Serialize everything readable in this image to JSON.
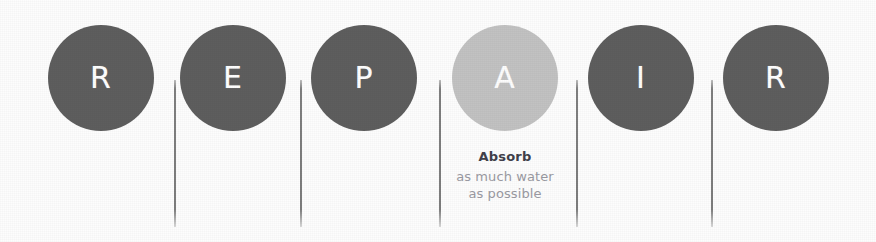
{
  "figure": {
    "acronym": "REPAIR",
    "background_color": "#fdfdfd",
    "dark_circle_color": "#5e5e5e",
    "light_circle_color": "#c2c2c2",
    "divider_color": "#787878",
    "letter_color": "#ffffff",
    "caption_title_color": "#40404a",
    "caption_body_color": "#9a9aa2"
  },
  "steps": [
    {
      "letter": "R",
      "highlighted": false,
      "caption_title": "",
      "caption_line1": "",
      "caption_line2": ""
    },
    {
      "letter": "E",
      "highlighted": false,
      "caption_title": "",
      "caption_line1": "",
      "caption_line2": ""
    },
    {
      "letter": "P",
      "highlighted": false,
      "caption_title": "",
      "caption_line1": "",
      "caption_line2": ""
    },
    {
      "letter": "A",
      "highlighted": true,
      "caption_title": "Absorb",
      "caption_line1": "as much water",
      "caption_line2": "as possible"
    },
    {
      "letter": "I",
      "highlighted": false,
      "caption_title": "",
      "caption_line1": "",
      "caption_line2": ""
    },
    {
      "letter": "R",
      "highlighted": false,
      "caption_title": "",
      "caption_line1": "",
      "caption_line2": ""
    }
  ]
}
